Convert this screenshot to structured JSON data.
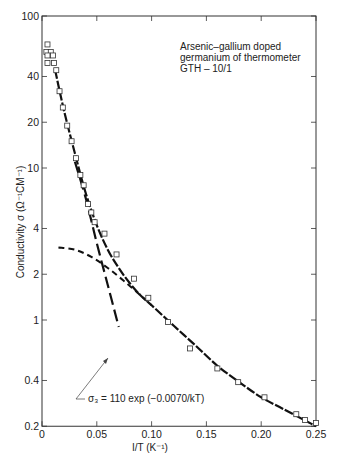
{
  "chart_data": {
    "type": "scatter",
    "title": "",
    "annotation_box": [
      "Arsenic–gallium doped",
      "germanium of thermometer",
      "GTH – 10/1"
    ],
    "xlabel": "I/T (K⁻¹)",
    "ylabel": "Conductivity σ (Ω⁻¹CM⁻¹)",
    "xlim": [
      0,
      0.25
    ],
    "ylim": [
      0.2,
      100
    ],
    "yscale": "log",
    "grid": false,
    "x_ticks": [
      0,
      0.05,
      0.1,
      0.15,
      0.2,
      0.25
    ],
    "x_tick_labels": [
      "0",
      "0.05",
      "0.10",
      "0.15",
      "0.20",
      "0.25"
    ],
    "y_ticks": [
      0.2,
      0.4,
      1,
      2,
      4,
      10,
      20,
      40,
      100
    ],
    "y_tick_labels": [
      "0.2",
      "0.4",
      "1",
      "2",
      "4",
      "10",
      "20",
      "40",
      "100"
    ],
    "series": [
      {
        "name": "Measured data",
        "style": "open-square-markers",
        "x": [
          0.005,
          0.004,
          0.008,
          0.005,
          0.01,
          0.005,
          0.011,
          0.013,
          0.016,
          0.019,
          0.023,
          0.027,
          0.031,
          0.035,
          0.038,
          0.042,
          0.045,
          0.048,
          0.057,
          0.068,
          0.084,
          0.097,
          0.115,
          0.135,
          0.16,
          0.179,
          0.203,
          0.232,
          0.24,
          0.25
        ],
        "y": [
          65,
          58,
          58,
          55,
          55,
          49,
          49,
          44,
          32,
          25,
          19,
          15,
          11.6,
          9,
          7.7,
          5.8,
          5.1,
          4.4,
          3.7,
          2.7,
          1.87,
          1.4,
          0.97,
          0.65,
          0.48,
          0.39,
          0.31,
          0.24,
          0.22,
          0.21
        ]
      },
      {
        "name": "Total fit",
        "style": "solid-dash-dot line",
        "x": [
          0.012,
          0.02,
          0.03,
          0.04,
          0.05,
          0.06,
          0.07,
          0.08,
          0.09,
          0.1,
          0.12,
          0.14,
          0.16,
          0.18,
          0.2,
          0.22,
          0.25
        ],
        "y": [
          44,
          24,
          12.5,
          6.8,
          4.2,
          2.9,
          2.2,
          1.75,
          1.45,
          1.25,
          0.92,
          0.68,
          0.5,
          0.39,
          0.31,
          0.26,
          0.2
        ]
      },
      {
        "name": "σ₃ = 110 exp(−0.0070/kT)",
        "style": "long-dash line",
        "x": [
          0.03,
          0.04,
          0.05,
          0.06,
          0.07
        ],
        "y": [
          11,
          6.3,
          3.2,
          1.7,
          0.9
        ]
      },
      {
        "name": "Low-temperature component",
        "style": "short-dash line",
        "x": [
          0.015,
          0.03,
          0.045,
          0.06,
          0.075,
          0.09,
          0.1
        ],
        "y": [
          3.0,
          2.9,
          2.6,
          2.2,
          1.8,
          1.45,
          1.25
        ]
      }
    ],
    "annotations": [
      {
        "text": "σ₃ = 110 exp (−0.0070/kT)",
        "arrow_to": [
          0.064,
          0.55
        ]
      }
    ]
  },
  "labels": {
    "box_line1": "Arsenic–gallium doped",
    "box_line2": "germanium of thermometer",
    "box_line3": "GTH – 10/1",
    "xlabel": "I/T (K⁻¹)",
    "ylabel": "Conductivity σ (Ω⁻¹CM⁻¹)",
    "annotation": "σ₃ = 110 exp (−0.0070/kT)"
  }
}
